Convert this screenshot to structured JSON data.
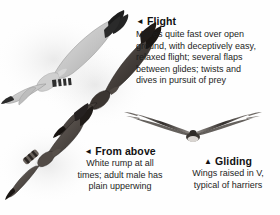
{
  "page": {
    "background_color": "#fefefe",
    "text_color": "#1a1a1a"
  },
  "markers": {
    "left_triangle": "◄",
    "up_triangle": "▲"
  },
  "captions": [
    {
      "id": "flight",
      "marker": "◄",
      "heading": "Flight",
      "lines": [
        "Moves quite fast over open",
        "ground, with deceptively easy,",
        "relaxed flight; several flaps",
        "between glides; twists and",
        "dives in pursuit of prey"
      ],
      "align": "left"
    },
    {
      "id": "from-above",
      "marker": "◄",
      "heading": "From above",
      "lines": [
        "White rump at all",
        "times; adult male has",
        "plain upperwing"
      ],
      "align": "center"
    },
    {
      "id": "gliding",
      "marker": "▲",
      "heading": "Gliding",
      "lines": [
        "Wings raised in V,",
        "typical of harriers"
      ],
      "align": "center"
    }
  ],
  "illustrations": [
    {
      "id": "pale-harrier-underside",
      "name": "pale-grey-harrier-flying",
      "description": "Pale grey harrier seen from below with black wingtips",
      "body_color": "#c9c9c9",
      "wingtip_color": "#1d1d1d"
    },
    {
      "id": "dark-harrier-underside",
      "name": "dark-brown-harrier-flying",
      "description": "Dark brown harrier in flight, banked",
      "body_color": "#4a4440",
      "wingtip_color": "#241f1c"
    },
    {
      "id": "harrier-from-above",
      "name": "harrier-upperwing-view",
      "description": "Harrier seen from above showing white rump",
      "body_color": "#5a5450",
      "rump_color": "#f2f2f2"
    },
    {
      "id": "gliding-silhouette",
      "name": "harrier-gliding-silhouette",
      "description": "Head-on silhouette with wings raised in a shallow V",
      "body_color": "#3a3632"
    }
  ]
}
